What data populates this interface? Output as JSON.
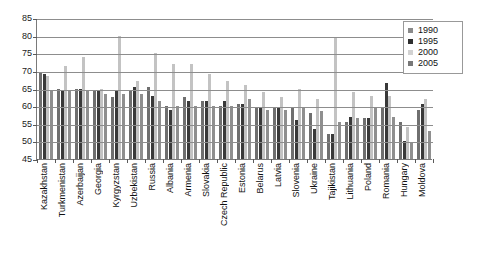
{
  "chart_data": {
    "type": "bar",
    "title": "",
    "subtitle": "",
    "xlabel": "",
    "ylabel": "",
    "ylim": [
      45,
      85
    ],
    "ytick_step": 5,
    "yticks": [
      85,
      80,
      75,
      70,
      65,
      60,
      55,
      50,
      45
    ],
    "grid": true,
    "legend_position": "top-right",
    "categories": [
      "Kazakhstan",
      "Turkmenistan",
      "Azerbaijan",
      "Georgia",
      "Kyrgyzstan",
      "Uzbekistan",
      "Russia",
      "Albania",
      "Armenia",
      "Slovakia",
      "Czech Republic",
      "Estonia",
      "Belarus",
      "Latvia",
      "Slovenia",
      "Ukraine",
      "Tajikistan",
      "Lithuania",
      "Poland",
      "Romania",
      "Hungary",
      "Moldova"
    ],
    "series": [
      {
        "name": "1990",
        "color": "#6f6f6f",
        "values": [
          69.5,
          65.0,
          65.0,
          64.5,
          62.5,
          64.5,
          65.5,
          60.0,
          62.5,
          61.5,
          60.0,
          60.5,
          59.5,
          59.5,
          59.5,
          58.0,
          52.0,
          55.5,
          56.5,
          59.5,
          55.5,
          59.0
        ]
      },
      {
        "name": "1995",
        "color": "#393939",
        "values": [
          69.0,
          64.5,
          65.0,
          64.5,
          64.5,
          65.5,
          63.0,
          59.0,
          61.5,
          61.5,
          61.5,
          60.5,
          59.5,
          59.5,
          56.0,
          53.5,
          52.0,
          57.0,
          56.5,
          66.5,
          50.0,
          60.5
        ]
      },
      {
        "name": "2000",
        "color": "#c3c3c3",
        "values": [
          68.5,
          71.5,
          74.0,
          65.0,
          80.0,
          67.0,
          75.0,
          72.0,
          72.0,
          69.0,
          67.0,
          66.0,
          64.0,
          62.5,
          65.0,
          62.0,
          79.5,
          64.0,
          63.0,
          63.0,
          54.0,
          62.0
        ]
      },
      {
        "name": "2005",
        "color": "#8f8f8f",
        "values": [
          64.5,
          64.5,
          64.5,
          63.5,
          63.5,
          63.5,
          61.5,
          60.0,
          60.0,
          60.0,
          60.0,
          62.0,
          59.0,
          59.0,
          59.5,
          58.5,
          55.5,
          56.5,
          59.5,
          57.0,
          49.5,
          53.0
        ]
      }
    ]
  },
  "legend": {
    "items": [
      {
        "label": "1990"
      },
      {
        "label": "1995"
      },
      {
        "label": "2000"
      },
      {
        "label": "2005"
      }
    ]
  }
}
